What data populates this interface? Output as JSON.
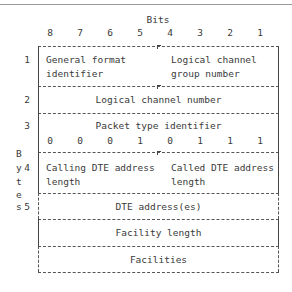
{
  "header": {
    "bits_label": "Bits",
    "bit_numbers": [
      "8",
      "7",
      "6",
      "5",
      "4",
      "3",
      "2",
      "1"
    ]
  },
  "side_label": {
    "letters": [
      "B",
      "y",
      "t",
      "e",
      "s"
    ]
  },
  "rows": [
    {
      "byte": "1",
      "left": [
        "General format",
        "identifier"
      ],
      "right": [
        "Logical channel",
        "group number"
      ]
    },
    {
      "byte": "2",
      "label": "Logical channel number"
    },
    {
      "byte": "3",
      "label": "Packet type identifier",
      "bits": [
        "0",
        "0",
        "0",
        "1",
        "0",
        "1",
        "1",
        "1"
      ]
    },
    {
      "byte": "4",
      "left": [
        "Calling DTE address",
        "length"
      ],
      "right": [
        "Called DTE address",
        "length"
      ]
    },
    {
      "byte": "5",
      "label": "DTE address(es)"
    },
    {
      "byte": "",
      "label": "Facility length"
    },
    {
      "byte": "",
      "label": "Facilities"
    }
  ]
}
